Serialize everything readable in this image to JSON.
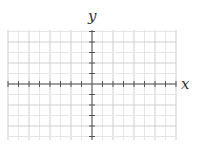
{
  "diagram": {
    "type": "coordinate-plane",
    "axis_labels": {
      "x": "x",
      "y": "y"
    },
    "grid": {
      "left": 8,
      "right": 176,
      "top": 30,
      "bottom": 140,
      "origin_x": 92,
      "origin_y": 84,
      "spacing": 10.5,
      "minor_color": "#e6e6e6",
      "major_color": "#cfcfcf"
    },
    "axis_color": "#555555",
    "tick_length": 3
  }
}
